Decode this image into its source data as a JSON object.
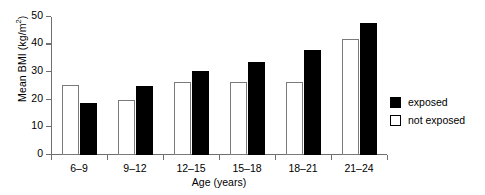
{
  "chart_data": {
    "type": "bar",
    "title": "",
    "xlabel": "Age (years)",
    "ylabel": "Mean BMI (kg/m²)",
    "ylabel_main": "Mean BMI (kg/m",
    "ylabel_sup": "2",
    "ylabel_close": ")",
    "categories": [
      "6–9",
      "9–12",
      "12–15",
      "15–18",
      "18–21",
      "21–24"
    ],
    "series": [
      {
        "name": "not exposed",
        "color": "#ffffff",
        "values": [
          25.5,
          20.0,
          26.5,
          26.5,
          26.3,
          42.0
        ]
      },
      {
        "name": "exposed",
        "color": "#000000",
        "values": [
          18.7,
          25.0,
          30.6,
          33.8,
          38.0,
          48.0
        ]
      }
    ],
    "ylim": [
      0,
      50
    ],
    "yticks": [
      0,
      10,
      20,
      30,
      40,
      50
    ],
    "ytick_labels": [
      "0",
      "10",
      "20",
      "30",
      "40",
      "50"
    ],
    "grid": false,
    "legend_position": "right"
  },
  "legend": {
    "entries": [
      {
        "label": "exposed",
        "swatch": "filled-black-square"
      },
      {
        "label": "not exposed",
        "swatch": "open-white-square"
      }
    ]
  }
}
